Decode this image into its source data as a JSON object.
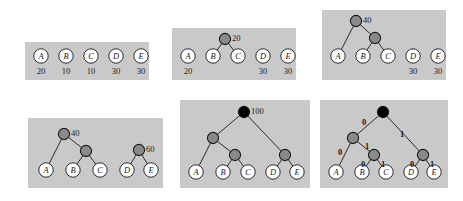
{
  "figure": {
    "canvas": {
      "width": 463,
      "height": 201
    },
    "colors": {
      "page_background": "#ffffff",
      "panel_background": "#c9c9c9",
      "leaf_fill": "#ffffff",
      "internal_fill": "#8a8a8a",
      "root_fill": "#000000",
      "stroke": "#1a1a1a",
      "text": "#1a1a1a"
    },
    "symbols": [
      "A",
      "B",
      "C",
      "D",
      "E"
    ],
    "initial_weights": [
      20,
      10,
      10,
      30,
      30
    ],
    "bits": {
      "left": "0",
      "right": "1"
    }
  },
  "panels": [
    {
      "id": "panel-1",
      "step": 1,
      "caption": "initial forest",
      "box": {
        "x": 25,
        "y": 42,
        "w": 124,
        "h": 38
      },
      "leaves": [
        {
          "label": "A",
          "x": 16,
          "y": 14,
          "weight": "20"
        },
        {
          "label": "B",
          "x": 41,
          "y": 14,
          "weight": "10"
        },
        {
          "label": "C",
          "x": 66,
          "y": 14,
          "weight": "10"
        },
        {
          "label": "D",
          "x": 91,
          "y": 14,
          "weight": "30"
        },
        {
          "label": "E",
          "x": 116,
          "y": 14,
          "weight": "30"
        }
      ],
      "internals": [],
      "edges": [],
      "bitlabels": []
    },
    {
      "id": "panel-2",
      "step": 2,
      "caption": "merge B and C into 20",
      "box": {
        "x": 172,
        "y": 28,
        "w": 124,
        "h": 52
      },
      "leaves": [
        {
          "label": "A",
          "x": 16,
          "y": 28,
          "weight": "20"
        },
        {
          "label": "B",
          "x": 41,
          "y": 28,
          "weight": ""
        },
        {
          "label": "C",
          "x": 66,
          "y": 28,
          "weight": ""
        },
        {
          "label": "D",
          "x": 91,
          "y": 28,
          "weight": "30"
        },
        {
          "label": "E",
          "x": 116,
          "y": 28,
          "weight": "30"
        }
      ],
      "internals": [
        {
          "x": 53,
          "y": 11,
          "fill": "internal",
          "value": "20",
          "value_side": "right"
        }
      ],
      "edges": [
        {
          "x1": 53,
          "y1": 11,
          "x2": 41,
          "y2": 28
        },
        {
          "x1": 53,
          "y1": 11,
          "x2": 66,
          "y2": 28
        }
      ],
      "bitlabels": []
    },
    {
      "id": "panel-3",
      "step": 3,
      "caption": "merge A with 20 into 40",
      "box": {
        "x": 322,
        "y": 10,
        "w": 124,
        "h": 70
      },
      "leaves": [
        {
          "label": "A",
          "x": 16,
          "y": 46,
          "weight": ""
        },
        {
          "label": "B",
          "x": 41,
          "y": 46,
          "weight": ""
        },
        {
          "label": "C",
          "x": 66,
          "y": 46,
          "weight": ""
        },
        {
          "label": "D",
          "x": 91,
          "y": 46,
          "weight": "30"
        },
        {
          "label": "E",
          "x": 116,
          "y": 46,
          "weight": "30"
        }
      ],
      "internals": [
        {
          "x": 34,
          "y": 11,
          "fill": "internal",
          "value": "40",
          "value_side": "right"
        },
        {
          "x": 53,
          "y": 28,
          "fill": "internal",
          "value": "",
          "value_side": "right"
        }
      ],
      "edges": [
        {
          "x1": 34,
          "y1": 11,
          "x2": 16,
          "y2": 46
        },
        {
          "x1": 34,
          "y1": 11,
          "x2": 53,
          "y2": 28
        },
        {
          "x1": 53,
          "y1": 28,
          "x2": 41,
          "y2": 46
        },
        {
          "x1": 53,
          "y1": 28,
          "x2": 66,
          "y2": 46
        }
      ],
      "bitlabels": []
    },
    {
      "id": "panel-4",
      "step": 4,
      "caption": "merge D and E into 60",
      "box": {
        "x": 28,
        "y": 118,
        "w": 135,
        "h": 70
      },
      "leaves": [
        {
          "label": "A",
          "x": 18,
          "y": 52,
          "weight": ""
        },
        {
          "label": "B",
          "x": 45,
          "y": 52,
          "weight": ""
        },
        {
          "label": "C",
          "x": 72,
          "y": 52,
          "weight": ""
        },
        {
          "label": "D",
          "x": 99,
          "y": 52,
          "weight": ""
        },
        {
          "label": "E",
          "x": 123,
          "y": 52,
          "weight": ""
        }
      ],
      "internals": [
        {
          "x": 36,
          "y": 16,
          "fill": "internal",
          "value": "40",
          "value_side": "right"
        },
        {
          "x": 58,
          "y": 33,
          "fill": "internal",
          "value": "",
          "value_side": "right"
        },
        {
          "x": 111,
          "y": 32,
          "fill": "internal",
          "value": "60",
          "value_side": "right"
        }
      ],
      "edges": [
        {
          "x1": 36,
          "y1": 16,
          "x2": 18,
          "y2": 52
        },
        {
          "x1": 36,
          "y1": 16,
          "x2": 58,
          "y2": 33
        },
        {
          "x1": 58,
          "y1": 33,
          "x2": 45,
          "y2": 52
        },
        {
          "x1": 58,
          "y1": 33,
          "x2": 72,
          "y2": 52
        },
        {
          "x1": 111,
          "y1": 32,
          "x2": 99,
          "y2": 52
        },
        {
          "x1": 111,
          "y1": 32,
          "x2": 123,
          "y2": 52
        }
      ],
      "bitlabels": []
    },
    {
      "id": "panel-5",
      "step": 5,
      "caption": "final Huffman tree, root 100",
      "box": {
        "x": 180,
        "y": 100,
        "w": 130,
        "h": 88
      },
      "leaves": [
        {
          "label": "A",
          "x": 16,
          "y": 72,
          "weight": ""
        },
        {
          "label": "B",
          "x": 43,
          "y": 72,
          "weight": ""
        },
        {
          "label": "C",
          "x": 68,
          "y": 72,
          "weight": ""
        },
        {
          "label": "D",
          "x": 93,
          "y": 72,
          "weight": ""
        },
        {
          "label": "E",
          "x": 117,
          "y": 72,
          "weight": ""
        }
      ],
      "internals": [
        {
          "x": 64,
          "y": 12,
          "fill": "root",
          "value": "100",
          "value_side": "right"
        },
        {
          "x": 33,
          "y": 38,
          "fill": "internal",
          "value": "",
          "value_side": "right"
        },
        {
          "x": 55,
          "y": 55,
          "fill": "internal",
          "value": "",
          "value_side": "right"
        },
        {
          "x": 105,
          "y": 55,
          "fill": "internal",
          "value": "",
          "value_side": "right"
        }
      ],
      "edges": [
        {
          "x1": 64,
          "y1": 12,
          "x2": 33,
          "y2": 38
        },
        {
          "x1": 64,
          "y1": 12,
          "x2": 105,
          "y2": 55
        },
        {
          "x1": 33,
          "y1": 38,
          "x2": 16,
          "y2": 72
        },
        {
          "x1": 33,
          "y1": 38,
          "x2": 55,
          "y2": 55
        },
        {
          "x1": 55,
          "y1": 55,
          "x2": 43,
          "y2": 72
        },
        {
          "x1": 55,
          "y1": 55,
          "x2": 68,
          "y2": 72
        },
        {
          "x1": 105,
          "y1": 55,
          "x2": 93,
          "y2": 72
        },
        {
          "x1": 105,
          "y1": 55,
          "x2": 117,
          "y2": 72
        }
      ],
      "bitlabels": []
    },
    {
      "id": "panel-6",
      "step": 6,
      "caption": "tree labelled with 0/1 codes",
      "box": {
        "x": 320,
        "y": 100,
        "w": 128,
        "h": 88
      },
      "leaves": [
        {
          "label": "A",
          "x": 16,
          "y": 72,
          "weight": ""
        },
        {
          "label": "B",
          "x": 42,
          "y": 72,
          "weight": ""
        },
        {
          "label": "C",
          "x": 66,
          "y": 72,
          "weight": ""
        },
        {
          "label": "D",
          "x": 91,
          "y": 72,
          "weight": ""
        },
        {
          "label": "E",
          "x": 114,
          "y": 72,
          "weight": ""
        }
      ],
      "internals": [
        {
          "x": 63,
          "y": 12,
          "fill": "root",
          "value": "",
          "value_side": "right"
        },
        {
          "x": 33,
          "y": 38,
          "fill": "internal",
          "value": "",
          "value_side": "right"
        },
        {
          "x": 54,
          "y": 55,
          "fill": "internal",
          "value": "",
          "value_side": "right"
        },
        {
          "x": 103,
          "y": 55,
          "fill": "internal",
          "value": "",
          "value_side": "right"
        }
      ],
      "edges": [
        {
          "x1": 63,
          "y1": 12,
          "x2": 33,
          "y2": 38
        },
        {
          "x1": 63,
          "y1": 12,
          "x2": 103,
          "y2": 55
        },
        {
          "x1": 33,
          "y1": 38,
          "x2": 16,
          "y2": 72
        },
        {
          "x1": 33,
          "y1": 38,
          "x2": 54,
          "y2": 55
        },
        {
          "x1": 54,
          "y1": 55,
          "x2": 42,
          "y2": 72
        },
        {
          "x1": 54,
          "y1": 55,
          "x2": 66,
          "y2": 72
        },
        {
          "x1": 103,
          "y1": 55,
          "x2": 91,
          "y2": 72
        },
        {
          "x1": 103,
          "y1": 55,
          "x2": 114,
          "y2": 72
        }
      ],
      "bitlabels": [
        {
          "text": "0",
          "x": 42,
          "y": 18
        },
        {
          "text": "1",
          "x": 80,
          "y": 30
        },
        {
          "text": "0",
          "x": 18,
          "y": 48
        },
        {
          "text": "1",
          "x": 45,
          "y": 42
        },
        {
          "text": "0",
          "x": 41,
          "y": 60
        },
        {
          "text": "1",
          "x": 61,
          "y": 60
        },
        {
          "text": "0",
          "x": 90,
          "y": 60
        },
        {
          "text": "1",
          "x": 110,
          "y": 60
        }
      ]
    }
  ]
}
